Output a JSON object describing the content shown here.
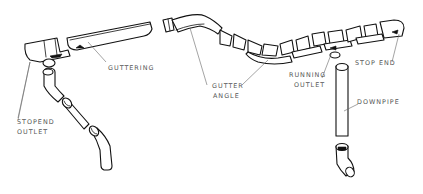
{
  "diagram": {
    "type": "exploded-view illustration",
    "labels": [
      {
        "id": "guttering",
        "lines": [
          "GUTTERING"
        ]
      },
      {
        "id": "gutter_angle",
        "lines": [
          "GUTTER",
          "ANGLE"
        ]
      },
      {
        "id": "running_outlet",
        "lines": [
          "RUNNING",
          "OUTLET"
        ]
      },
      {
        "id": "stop_end",
        "lines": [
          "STOP END"
        ]
      },
      {
        "id": "downpipe",
        "lines": [
          "DOWNPIPE"
        ]
      },
      {
        "id": "stopend_outlet",
        "lines": [
          "STOPEND",
          "OUTLET"
        ]
      }
    ],
    "colors": {
      "ink": "#111111",
      "label": "#555555",
      "background": "#ffffff"
    }
  }
}
